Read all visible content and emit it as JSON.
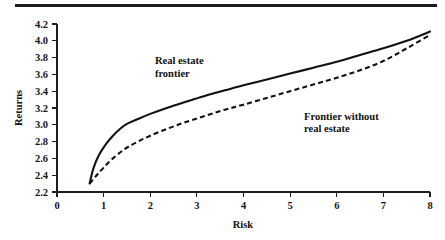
{
  "figure": {
    "top_rule": "horizontal-rule",
    "background": "#ffffff",
    "ink_color": "#111111"
  },
  "chart_data": {
    "type": "line",
    "title": "",
    "subtitle": "",
    "xlabel": "Risk",
    "ylabel": "Returns",
    "xlim": [
      0,
      8
    ],
    "ylim": [
      2.2,
      4.2
    ],
    "grid": false,
    "legend_position": "inline-annotations",
    "xticks": [
      "0",
      "1",
      "2",
      "3",
      "4",
      "5",
      "6",
      "7",
      "8"
    ],
    "yticks": [
      "2.2",
      "2.4",
      "2.6",
      "2.8",
      "3.0",
      "3.2",
      "3.4",
      "3.6",
      "3.8",
      "4.0",
      "4.2"
    ],
    "annotations": [
      {
        "id": "real-estate-frontier",
        "lines": [
          "Real estate",
          "frontier"
        ],
        "x": 2.1,
        "y": 3.72
      },
      {
        "id": "frontier-without-real-estate",
        "lines": [
          "Frontier without",
          "real estate"
        ],
        "x": 5.3,
        "y": 3.06
      }
    ],
    "series": [
      {
        "name": "Real estate frontier",
        "style": "solid",
        "x": [
          0.7,
          0.78,
          0.9,
          1.05,
          1.2,
          1.35,
          1.5,
          1.7,
          2.0,
          2.4,
          2.8,
          3.2,
          3.6,
          4.0,
          4.5,
          5.0,
          5.5,
          6.0,
          6.5,
          7.0,
          7.5,
          8.0
        ],
        "y": [
          2.3,
          2.48,
          2.64,
          2.77,
          2.87,
          2.95,
          3.01,
          3.06,
          3.13,
          3.21,
          3.28,
          3.35,
          3.41,
          3.47,
          3.54,
          3.61,
          3.68,
          3.75,
          3.83,
          3.91,
          4.0,
          4.11
        ]
      },
      {
        "name": "Frontier without real estate",
        "style": "dashed",
        "x": [
          0.7,
          0.85,
          1.0,
          1.2,
          1.45,
          1.7,
          2.0,
          2.4,
          2.8,
          3.2,
          3.6,
          4.0,
          4.5,
          5.0,
          5.5,
          6.0,
          6.5,
          7.0,
          7.5,
          8.0
        ],
        "y": [
          2.3,
          2.4,
          2.49,
          2.6,
          2.71,
          2.79,
          2.87,
          2.96,
          3.04,
          3.11,
          3.18,
          3.24,
          3.32,
          3.4,
          3.48,
          3.56,
          3.65,
          3.76,
          3.91,
          4.07
        ]
      }
    ]
  }
}
